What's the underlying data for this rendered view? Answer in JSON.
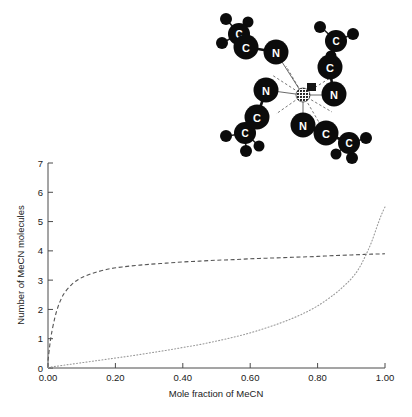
{
  "figure": {
    "name": "mecn-solvation-figure"
  },
  "chart_data": {
    "type": "line",
    "title": "",
    "xlabel": "Mole fraction of MeCN",
    "ylabel": "Number of MeCN molecules",
    "xlim": [
      0.0,
      1.0
    ],
    "ylim": [
      0,
      7
    ],
    "xticks": [
      "0.00",
      "0.20",
      "0.40",
      "0.60",
      "0.80",
      "1.00"
    ],
    "xtick_values": [
      0.0,
      0.2,
      0.4,
      0.6,
      0.8,
      1.0
    ],
    "yticks": [
      "0",
      "1",
      "2",
      "3",
      "4",
      "5",
      "6",
      "7"
    ],
    "ytick_values": [
      0,
      1,
      2,
      3,
      4,
      5,
      6,
      7
    ],
    "grid": false,
    "legend": "none",
    "series": [
      {
        "name": "first-shell-dashed",
        "style": "dashed",
        "color": "#555555",
        "x": [
          0.0,
          0.005,
          0.01,
          0.02,
          0.03,
          0.04,
          0.05,
          0.07,
          0.09,
          0.11,
          0.14,
          0.18,
          0.22,
          0.26,
          0.3,
          0.35,
          0.4,
          0.45,
          0.5,
          0.55,
          0.6,
          0.65,
          0.7,
          0.75,
          0.8,
          0.85,
          0.9,
          0.94,
          0.97,
          1.0
        ],
        "y": [
          0.25,
          0.75,
          1.15,
          1.7,
          2.1,
          2.38,
          2.58,
          2.85,
          3.02,
          3.14,
          3.26,
          3.38,
          3.45,
          3.5,
          3.54,
          3.58,
          3.62,
          3.65,
          3.68,
          3.7,
          3.73,
          3.75,
          3.77,
          3.79,
          3.81,
          3.84,
          3.86,
          3.88,
          3.89,
          3.9
        ]
      },
      {
        "name": "second-shell-dotted",
        "style": "dotted",
        "color": "#9a9a9a",
        "x": [
          0.0,
          0.05,
          0.1,
          0.15,
          0.2,
          0.25,
          0.3,
          0.35,
          0.4,
          0.45,
          0.5,
          0.55,
          0.6,
          0.65,
          0.7,
          0.75,
          0.8,
          0.85,
          0.88,
          0.9,
          0.92,
          0.94,
          0.96,
          0.98,
          0.99,
          1.0
        ],
        "y": [
          0.02,
          0.1,
          0.18,
          0.26,
          0.34,
          0.42,
          0.51,
          0.6,
          0.7,
          0.8,
          0.92,
          1.05,
          1.2,
          1.38,
          1.58,
          1.82,
          2.12,
          2.52,
          2.82,
          3.05,
          3.35,
          3.78,
          4.3,
          4.95,
          5.25,
          5.5
        ]
      }
    ]
  },
  "molecule": {
    "name": "metal-tetrakis-acetonitrile-complex",
    "central_atom_label": "",
    "atom_labels": {
      "nitrogen": "N",
      "carbon": "C"
    },
    "ligands": [
      {
        "id": "ligand-upper-left",
        "n": "N",
        "c": "C",
        "methyl": "C"
      },
      {
        "id": "ligand-upper-right",
        "n": "N",
        "c": "C",
        "methyl": "C"
      },
      {
        "id": "ligand-lower-left",
        "n": "N",
        "c": "C",
        "methyl": "C"
      },
      {
        "id": "ligand-lower-right",
        "n": "N",
        "c": "C",
        "methyl": "C"
      }
    ]
  },
  "colors": {
    "axis": "#4a4a4a",
    "dashed_curve": "#555555",
    "dotted_curve": "#9a9a9a",
    "atom_fill": "#0b0b0b",
    "atom_text": "#ffffff",
    "background": "#ffffff"
  }
}
